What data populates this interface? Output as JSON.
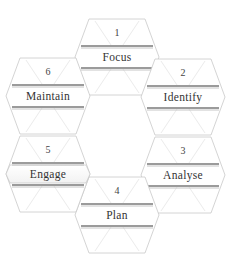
{
  "diagram": {
    "type": "hexagonal-cycle",
    "hexagons": [
      {
        "number": "1",
        "label": "Focus",
        "cx": 117,
        "cy": 57,
        "highlighted": false
      },
      {
        "number": "2",
        "label": "Identify",
        "cx": 183,
        "cy": 97,
        "highlighted": false
      },
      {
        "number": "3",
        "label": "Analyse",
        "cx": 183,
        "cy": 175,
        "highlighted": false
      },
      {
        "number": "4",
        "label": "Plan",
        "cx": 117,
        "cy": 215,
        "highlighted": false
      },
      {
        "number": "5",
        "label": "Engage",
        "cx": 48,
        "cy": 174,
        "highlighted": true
      },
      {
        "number": "6",
        "label": "Maintain",
        "cx": 48,
        "cy": 96,
        "highlighted": false
      }
    ],
    "colors": {
      "outline": "#c9c9c9",
      "bar": "#7a7a7a",
      "highlight_dark": "#3a3a3a",
      "highlight_light": "#f4f4f4",
      "text": "#333333"
    }
  }
}
